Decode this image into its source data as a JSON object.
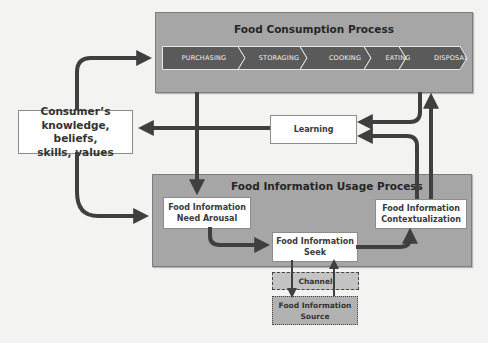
{
  "diagram": {
    "consumption_process": {
      "title": "Food Consumption Process",
      "steps": [
        {
          "label": "PURCHASING"
        },
        {
          "label": "STORAGING"
        },
        {
          "label": "COOKING"
        },
        {
          "label": "EATING"
        },
        {
          "label": "DISPOSAL"
        }
      ]
    },
    "consumer_box": {
      "line1": "Consumer’s",
      "line2": "knowledge, beliefs,",
      "line3": "skills, values"
    },
    "learning_box": {
      "label": "Learning"
    },
    "usage_process": {
      "title": "Food Information Usage Process",
      "need_arousal": {
        "line1": "Food Information",
        "line2": "Need Arousal"
      },
      "seek": {
        "line1": "Food Information",
        "line2": "Seek"
      },
      "contextualization": {
        "line1": "Food Information",
        "line2": "Contextualization"
      }
    },
    "channel_box": {
      "label": "Channel"
    },
    "source_box": {
      "line1": "Food Information",
      "line2": "Source"
    },
    "colors": {
      "panel_fill": "#a6a6a6",
      "chevron_fill": "#5a5a5a",
      "arrow": "#3f3f3f",
      "box_fill": "#fefefe",
      "background": "#f3f3f1"
    }
  }
}
